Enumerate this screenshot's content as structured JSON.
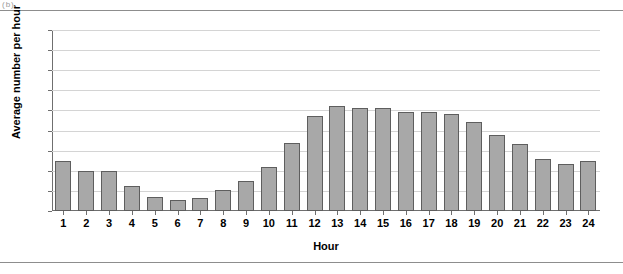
{
  "page": {
    "top_fragment": "(b)",
    "rule_color": "#8d8d8d"
  },
  "chart_data": {
    "type": "bar",
    "title": "",
    "subtitle": "",
    "xlabel": "Hour",
    "ylabel": "Average number per hour",
    "categories": [
      "1",
      "2",
      "3",
      "4",
      "5",
      "6",
      "7",
      "8",
      "9",
      "10",
      "11",
      "12",
      "13",
      "14",
      "15",
      "16",
      "17",
      "18",
      "19",
      "20",
      "21",
      "22",
      "23",
      "24"
    ],
    "values": [
      25,
      20,
      20,
      12.5,
      7,
      5.5,
      6.5,
      10.5,
      15,
      22,
      34,
      47,
      52,
      51,
      51,
      49,
      49,
      48,
      44.5,
      38,
      33.5,
      26,
      23.5,
      25
    ],
    "ylim": [
      0,
      90
    ],
    "ytick_values": [
      0,
      10,
      20,
      30,
      40,
      50,
      60,
      70,
      80,
      90
    ],
    "ytick_labels": [
      "0",
      "10",
      "20",
      "30",
      "40",
      "50",
      "60",
      "70",
      "80",
      "90"
    ],
    "grid": true,
    "legend": false,
    "legend_position": "none",
    "bar_color": "#a8a8a8",
    "bar_edge_color": "#5e5e5e",
    "grid_color": "#d4d4d4",
    "axis_color": "#6f6f6f"
  }
}
